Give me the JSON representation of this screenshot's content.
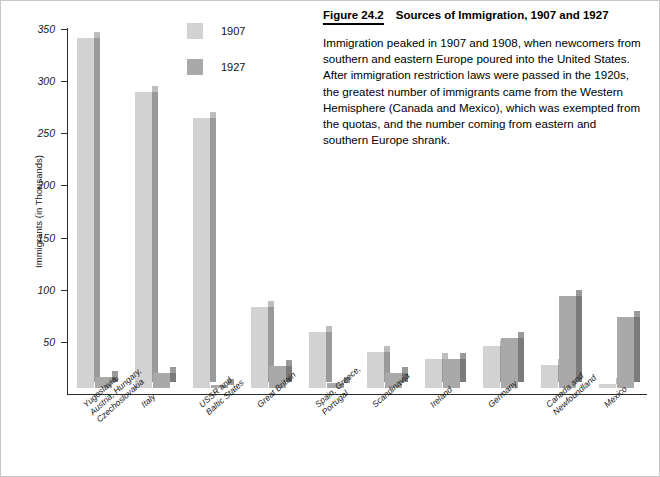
{
  "caption": {
    "figure_number": "Figure 24.2",
    "title": "Sources of Immigration, 1907 and 1927",
    "body": "Immigration peaked in 1907 and 1908, when newcomers from southern and eastern Europe poured into the United States. After immigration restriction laws were passed in the 1920s, the greatest number of immigrants came from the Western Hemisphere (Canada and Mexico), which was exempted from the quotas, and the number coming from eastern and southern Europe shrank."
  },
  "legend": {
    "items": [
      {
        "label": "1907",
        "color": "#d2d2d2"
      },
      {
        "label": "1927",
        "color": "#a9a9a9"
      }
    ]
  },
  "chart_data": {
    "type": "bar",
    "title": "Sources of Immigration, 1907 and 1927",
    "xlabel": "",
    "ylabel": "Immigrants (in Thousands)",
    "ylim": [
      0,
      350
    ],
    "yticks": [
      50,
      100,
      150,
      200,
      250,
      300,
      350
    ],
    "grid": false,
    "legend_position": "top-center",
    "categories": [
      "Yugoslavia,\nAustria, Hungary,\nCzechoslovakia",
      "Italy",
      "USSR and\nBaltic States",
      "Great Britain",
      "Spain, Greece,\nPortugal",
      "Scandinavia",
      "Ireland",
      "Germany",
      "Canada and\nNewfoundland",
      "Mexico"
    ],
    "series": [
      {
        "name": "1907",
        "color": "#d2d2d2",
        "values": [
          336,
          284,
          259,
          78,
          54,
          35,
          28,
          40,
          22,
          4
        ]
      },
      {
        "name": "1927",
        "color": "#a9a9a9",
        "values": [
          11,
          14,
          3,
          21,
          5,
          14,
          28,
          48,
          88,
          68
        ]
      }
    ]
  }
}
